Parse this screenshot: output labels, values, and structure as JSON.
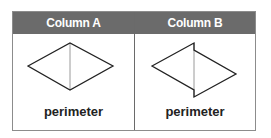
{
  "table": {
    "columns": [
      {
        "header": "Column A",
        "label": "perimeter",
        "shape": "rhombus-with-vertical-diagonal"
      },
      {
        "header": "Column B",
        "label": "perimeter",
        "shape": "two-triangles-offset-along-vertical-line"
      }
    ]
  },
  "colors": {
    "header_bg": "#6b6b6b",
    "header_text": "#ffffff",
    "shape_stroke": "#222222",
    "diagonal_stroke": "#9a9a9a",
    "border": "#8c8c8c"
  }
}
